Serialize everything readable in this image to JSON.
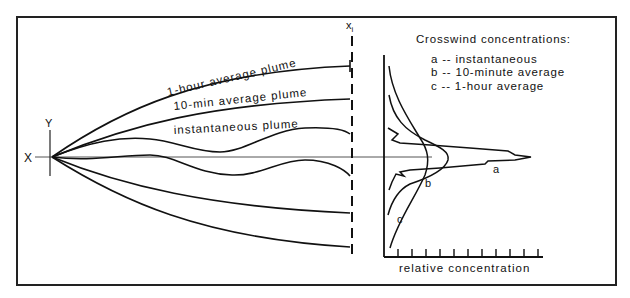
{
  "diagram": {
    "axes": {
      "x_label": "X",
      "y_label": "Y",
      "xi_label": "x",
      "xi_subscript": "i"
    },
    "plume_labels": {
      "one_hour": "1-hour average plume",
      "ten_min": "10-min average plume",
      "instantaneous": "instantaneous plume"
    },
    "legend": {
      "title": "Crosswind concentrations:",
      "items": [
        {
          "key": "a",
          "sep": "--",
          "label": "instantaneous"
        },
        {
          "key": "b",
          "sep": "--",
          "label": "10-minute average"
        },
        {
          "key": "c",
          "sep": "--",
          "label": "1-hour average"
        }
      ]
    },
    "profile": {
      "curve_labels": {
        "a": "a",
        "b": "b",
        "c": "c"
      },
      "x_axis_label": "relative concentration",
      "tick_count": 11
    },
    "colors": {
      "line": "#111111",
      "background": "#ffffff",
      "frame": "#222222"
    }
  }
}
